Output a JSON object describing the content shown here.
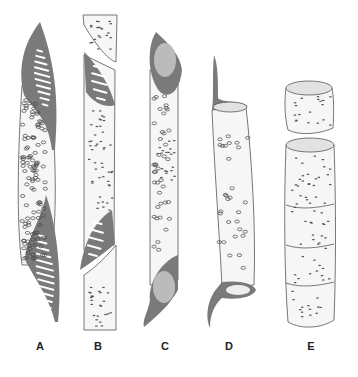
{
  "figure": {
    "panels": [
      {
        "id": "A",
        "label": "A",
        "description": "long tapering element with scalariform perforation plates at both ends"
      },
      {
        "id": "B",
        "label": "B",
        "description": "element with oblique scalariform perforation plate, overlapping neighbours"
      },
      {
        "id": "C",
        "label": "C",
        "description": "element with simple oblique perforations and tails"
      },
      {
        "id": "D",
        "label": "D",
        "description": "element with simple transverse perforations and tail"
      },
      {
        "id": "E",
        "label": "E",
        "description": "short drum-shaped elements stacked in a vessel"
      }
    ]
  },
  "colors": {
    "wall": "#7a7a7a",
    "outline": "#555555",
    "background": "#ffffff"
  }
}
